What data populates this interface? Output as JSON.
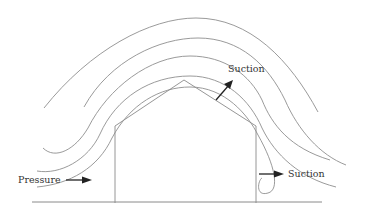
{
  "diagram": {
    "labels": {
      "pressure": "Pressure",
      "suction_roof": "Suction",
      "suction_leeward": "Suction"
    },
    "components": {
      "house": "gable-roof building outline",
      "ground": "ground line",
      "streamlines": 5,
      "arrows": [
        "pressure-arrow (windward, pointing right into wall)",
        "roof-suction-arrow (pointing up-right away from roof)",
        "leeward-suction-arrow (pointing right away from wall)"
      ]
    },
    "colors": {
      "lines": "#8f8f8f",
      "arrows": "#222222",
      "text": "#333333"
    }
  }
}
